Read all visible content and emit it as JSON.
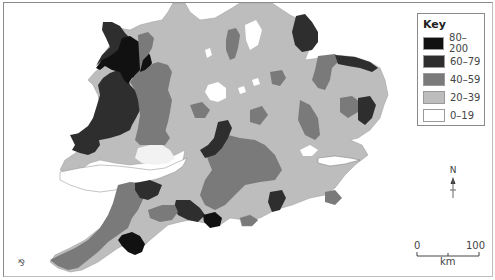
{
  "map": {
    "title": "Choropleth map of England and Wales",
    "key": {
      "title": "Key",
      "classes": [
        {
          "label": "80–200",
          "color": "#111111"
        },
        {
          "label": "60–79",
          "color": "#2e2e2e"
        },
        {
          "label": "40–59",
          "color": "#7a7a7a"
        },
        {
          "label": "20–39",
          "color": "#bdbdbd"
        },
        {
          "label": "0–19",
          "color": "#ffffff"
        }
      ]
    },
    "north_arrow": {
      "label": "N"
    },
    "scale_bar": {
      "start": "0",
      "end": "100",
      "unit": "km"
    },
    "compass_mark": "⅋"
  }
}
